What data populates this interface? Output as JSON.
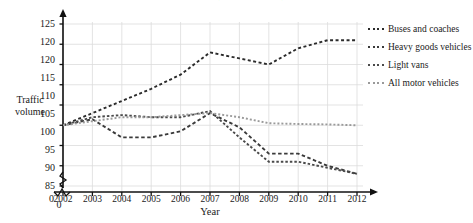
{
  "chart_data": {
    "type": "line",
    "title": "in Great Britain, from 2002 (Table TRA0101)",
    "xlabel": "Year",
    "ylabel_line1": "Traffic",
    "ylabel_line2": "volume",
    "categories": [
      "2002",
      "2003",
      "2004",
      "2005",
      "2006",
      "2007",
      "2008",
      "2009",
      "2010",
      "2011",
      "2012"
    ],
    "yticks": [
      "125",
      "120",
      "120",
      "115",
      "110",
      "105",
      "100",
      "95",
      "90",
      "85"
    ],
    "ytick_values": [
      125,
      120,
      115,
      110,
      105,
      100,
      95,
      90,
      85
    ],
    "ylim": [
      85,
      125
    ],
    "xlim": [
      2002,
      2012
    ],
    "origin_label_y": "0",
    "origin_label_x": "0",
    "grid": true,
    "axis_break": true,
    "legend_position": "right",
    "series": [
      {
        "name": "Buses and coaches",
        "color": "#2b2b2b",
        "dash": "3,2.5",
        "values": [
          100.0,
          103.0,
          106.0,
          109.0,
          112.5,
          118.0,
          116.5,
          115.0,
          119.0,
          121.0,
          121.0
        ]
      },
      {
        "name": "Heavy goods vehicles",
        "color": "#3a3a3a",
        "dash": "3.5,2.5",
        "values": [
          100.0,
          101.5,
          97.0,
          97.0,
          98.5,
          103.0,
          99.5,
          93.0,
          93.0,
          90.0,
          88.0
        ]
      },
      {
        "name": "Light vans",
        "color": "#4a4a4a",
        "dash": "2.5,2",
        "values": [
          100.0,
          102.0,
          102.5,
          102.0,
          102.0,
          103.5,
          97.0,
          91.0,
          91.0,
          89.5,
          88.0
        ]
      },
      {
        "name": "All motor vehicles",
        "color": "#9a9a9a",
        "dash": "2,2",
        "values": [
          100.0,
          101.0,
          102.0,
          102.0,
          102.5,
          103.0,
          102.0,
          100.5,
          100.3,
          100.2,
          100.0
        ]
      }
    ]
  }
}
